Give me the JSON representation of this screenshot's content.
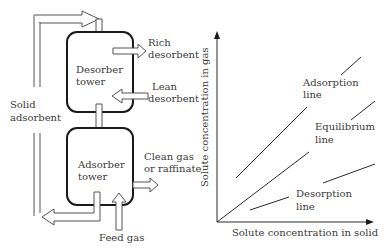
{
  "process_diagram": {
    "desorber": {
      "line1": "Desorber",
      "line2": "tower"
    },
    "adsorber": {
      "line1": "Adsorber",
      "line2": "tower"
    },
    "rich_desorbent": {
      "line1": "Rich",
      "line2": "desorbent"
    },
    "lean_desorbent": {
      "line1": "Lean",
      "line2": "desorbent"
    },
    "clean_gas": {
      "line1": "Clean gas",
      "line2": "or raffinate"
    },
    "solid_adsorbent": {
      "line1": "Solid",
      "line2": "adsorbent"
    },
    "feed_gas": "Feed gas"
  },
  "graph": {
    "ylabel": "Solute concentration in gas",
    "xlabel": "Solute concentration in solid",
    "adsorption_line": {
      "line1": "Adsorption",
      "line2": "line"
    },
    "equilibrium_line": {
      "line1": "Equilibrium",
      "line2": "line"
    },
    "desorption_line": {
      "line1": "Desorption",
      "line2": "line"
    }
  },
  "colors": {
    "ink": "#3a3a3a",
    "background": "#ffffff"
  }
}
